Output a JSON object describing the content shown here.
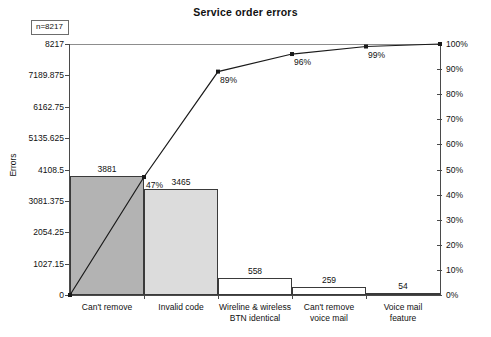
{
  "chart_data": {
    "type": "bar",
    "title": "Service order errors",
    "xlabel": "",
    "ylabel": "Errors",
    "categories": [
      "Can't remove",
      "Invalid code",
      "Wireline & wireless\nBTN identical",
      "Can't remove\nvoice mail",
      "Voice mail\nfeature"
    ],
    "values": [
      3881,
      3465,
      558,
      259,
      54
    ],
    "cumulative_percent": [
      47,
      89,
      96,
      99,
      100
    ],
    "cumulative_percent_labels": [
      "47%",
      "89%",
      "96%",
      "99%",
      "100%"
    ],
    "bar_value_labels": [
      "3881",
      "3465",
      "558",
      "259",
      "54"
    ],
    "ylim": [
      0,
      8217
    ],
    "y2lim": [
      0,
      100
    ],
    "yticks": [
      0,
      1027.15,
      2054.25,
      3081.375,
      4108.5,
      5135.625,
      6162.75,
      7189.875,
      8217
    ],
    "ytick_labels": [
      "0",
      "1027.15",
      "2054.25",
      "3081.375",
      "4108.5",
      "5135.625",
      "6162.75",
      "7189.875",
      "8217"
    ],
    "y2ticks": [
      0,
      10,
      20,
      30,
      40,
      50,
      60,
      70,
      80,
      90,
      100
    ],
    "y2tick_labels": [
      "0%",
      "10%",
      "20%",
      "30%",
      "40%",
      "50%",
      "60%",
      "70%",
      "80%",
      "90%",
      "100%"
    ],
    "annotation": "n=8217",
    "total": 8217,
    "grid": false,
    "legend": "none",
    "bar_colors": [
      "#b3b3b3",
      "#dcdcdc",
      "#ffffff",
      "#ffffff",
      "#ffffff"
    ],
    "line_color": "#1a1a1a",
    "marker": "square"
  }
}
